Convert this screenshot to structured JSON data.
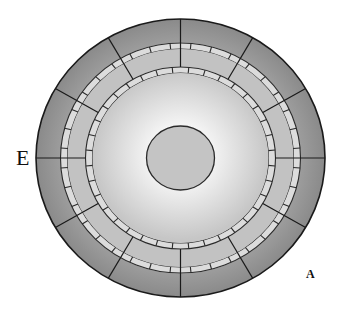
{
  "diagram": {
    "center": [
      180.5,
      158
    ],
    "outer_ring": {
      "rx": 144.5,
      "ry": 139,
      "fill": "#8a8a8a",
      "fill_inner": "#a0a0a0",
      "stroke": "#1a1a1a"
    },
    "middle_zone": {
      "rx": 120,
      "ry": 115,
      "fill_outer": "#b4b4b4",
      "fill_inner": "#d0d0d0"
    },
    "outer_brick_band": {
      "rx_outer": 120,
      "ry_outer": 115,
      "rx_inner": 113,
      "ry_inner": 109,
      "bricks": 36,
      "fill": "#dcdcdc",
      "stroke": "#2a2a2a"
    },
    "inner_zone": {
      "rx": 113,
      "ry": 109,
      "fill": "#c2c2c2"
    },
    "inner_brick_band": {
      "rx_outer": 95,
      "ry_outer": 91,
      "rx_inner": 88,
      "ry_inner": 85,
      "bricks": 36,
      "fill": "#dcdcdc",
      "stroke": "#2a2a2a"
    },
    "core_area": {
      "rx": 88,
      "ry": 85,
      "fill_center": "#ffffff",
      "fill_edge": "#c6c6c6"
    },
    "central_disc": {
      "rx": 34,
      "ry": 32,
      "fill": "#c4c4c4",
      "stroke": "#2a2a2a"
    },
    "spokes": {
      "count": 12,
      "start_deg": 0,
      "from": "inner_brick_band_outer",
      "to": "outer_ring",
      "stroke": "#1a1a1a"
    }
  },
  "labels": {
    "e": "E",
    "a": "A"
  }
}
